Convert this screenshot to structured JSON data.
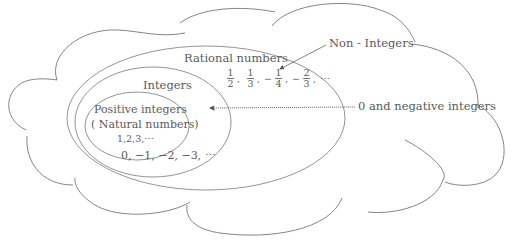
{
  "diagram": {
    "type": "nested-set-diagram",
    "outer_shape": "cloud",
    "sets": [
      {
        "id": "rational",
        "label": "Rational numbers"
      },
      {
        "id": "integers",
        "label": "Integers"
      },
      {
        "id": "positive",
        "label": "Positive integers",
        "sublabel": "( Natural numbers)",
        "examples": "1,2,3,⋯"
      }
    ],
    "integers_examples": "0, −1, −2, −3, ⋯",
    "rational_examples": {
      "fractions": [
        {
          "sign": "",
          "num": "1",
          "den": "2"
        },
        {
          "sign": "",
          "num": "1",
          "den": "3"
        },
        {
          "sign": "−",
          "num": "1",
          "den": "4"
        },
        {
          "sign": "−",
          "num": "2",
          "den": "3"
        }
      ],
      "separator": ",",
      "ellipsis": "⋯"
    },
    "annotations": [
      {
        "id": "non-integers",
        "label": "Non - Integers",
        "points_to": "rational-region"
      },
      {
        "id": "zero-negative",
        "label": "0 and negative integers",
        "points_to": "integers-region"
      }
    ],
    "colors": {
      "stroke": "#888888",
      "text": "#5a5a5a",
      "background": "#ffffff"
    }
  }
}
